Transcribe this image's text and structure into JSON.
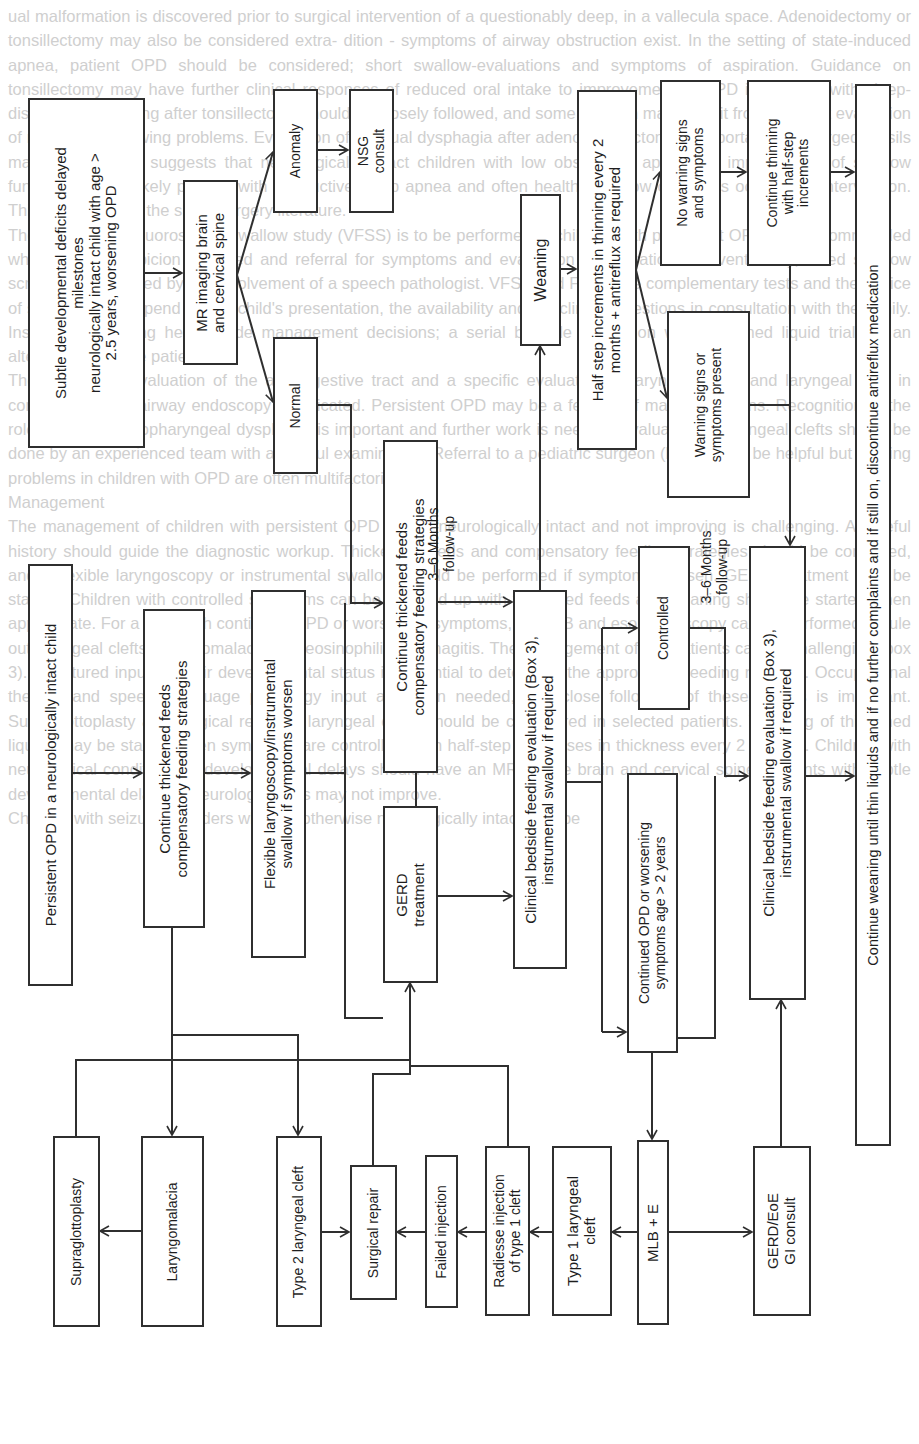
{
  "background_text": {
    "paragraphs": [
      "ual malformation is discovered prior to surgical intervention of a questionably deep, in a vallecula space. Adenoidectomy or tonsillectomy may also be considered extra- dition - symptoms of airway obstruction exist. In the setting of state-induced apnea, patient OPD should be considered; short swallow-evaluations and symptoms of aspiration. Guidance on tonsillectomy may have further clinical responses of reduced oral intake to improvement of OPD in children with sleep-disordered breathing after tonsillectomy should be closely followed, and some children may benefit from a repeat evaluation of reduced swallowing problems. Evaluation of residual dysphagia after adenotonsillectomy is important as enlarged tonsils may contribute to suggests that neurologically intact children with low obstructive apnea, an improvement of swallow function is more likely present with obstructive sleep apnea and often healthy swallow outcomes occur after intervention. This is also true of the sleep surgery literature.",
      "The use of video fluoroscopic swallow study (VFSS) is to be performed in children with persistent OPD. It is recommended when clinical suspicion is raised and referral for symptoms and evaluation of aspiration. Conventionally, failed swallow screening is followed by the involvement of a speech pathologist. VFSS and FEES are complementary tests and the choice of study should depend on the child's presentation, the availability and the clinical questions in consultation with the family. Instrumental testing helps guide management decisions; a serial bedside evaluation with thickened liquid trials is an alternative in some patients.",
      "The concurrent evaluation of the aerodigestive tract and a specific evaluation of laryngomalacia and laryngeal cleft in combination with airway endoscopy is indicated. Persistent OPD may be a feature of many conditions. Recognition of the role of reflux in oropharyngeal dysphagia is important and further work is needed. Evaluation of laryngeal clefts should be done by an experienced team with a careful examination. Referral to a pediatric surgeon (box 3) may be helpful but feeding problems in children with OPD are often multifactorial.",
      "Management",
      "The management of children with persistent OPD that is neurologically intact and not improving is challenging. A careful history should guide the diagnostic workup. Thickened feeds and compensatory feeding strategies should be continued, and a flexible laryngoscopy or instrumental swallow should be performed if symptoms worsen. GERD treatment may be started. Children with controlled symptoms can be followed up with thickened feeds and weaning should be started when appropriate. For a child with continued OPD or worsening symptoms, an MLB and esophagoscopy can be performed to rule out laryngeal clefts, laryngomalacia and eosinophilic esophagitis. The management of OP patients can be challenging (box 3). Structured input on their developmental status is essential to determine the appropriate feeding regimen. Occupational therapy and speech language pathology input are often needed, and close follow-up of these infants is important. Supraglottoplasty and surgical repair of laryngeal clefts should be considered in selected patients. Weaning of thickened liquids may be started when symptoms are controlled, with half-step decreases in thickness every 2 months. Children with neurological conditions or developmental delays should have an MRI of the brain and cervical spine. Patients with subtle developmental delays or neurologic signs may not improve.",
      "Children with seizure disorders who are otherwise neurologically intact may be"
    ]
  },
  "flowchart": {
    "boxes": {
      "subtle_deficits": "Subtle developmental  deficits delayed\nmilestones\nneurologically intact child with age >\n2.5 years, worsening OPD",
      "mr_imaging": "MR imaging brain\nand cervical spine",
      "anomaly": "Anomaly",
      "nsg_consult": "NSG\nconsult",
      "normal": "Normal",
      "persistent_opd": "Persistent OPD in a neurologically  intact child",
      "continue_thickened_1": "Continue thickened  feeds\ncompensatory feeding  strategies",
      "flexible_laryngoscopy": "Flexible  laryngoscopy/instrumental\nswallow  if symptoms  worsen",
      "continue_thickened_2": "Continue thickened  feeds\ncompensatory feeding  strategies",
      "gerd_treatment": "GERD\ntreatment",
      "clinical_bedside_1": "Clinical bedside feeding evaluation (Box 3),\ninstrumental swallow if required",
      "weaning": "Weaning",
      "half_step": "Half step increments in thinning  every 2\nmonths + antireflux as required",
      "no_warning": "No warning signs\nand symptoms",
      "warning_present": "Warning signs or\nsymptoms present",
      "continue_thinning": "Continue thinning\nwith half-step\nincrements",
      "controlled": "Controlled",
      "continued_opd": "Continued OPD or worsening\nsymptoms  age > 2 years",
      "clinical_bedside_2": "Clinical bedside feeding evaluation (Box 3),\ninstrumental swallow if required",
      "continue_weaning": "Continue weaning until thin liquids  and if no further complaints and if still on, discontinue antireflux medication",
      "supraglottoplasty": "Supraglottoplasty",
      "laryngomalacia": "Laryngomalacia",
      "type2_cleft": "Type 2 laryngeal cleft",
      "surgical_repair": "Surgical repair",
      "failed_injection": "Failed injection",
      "radiesse_injection": "Radiesse injection\nof type 1 cleft",
      "type1_cleft": "Type 1 laryngeal\ncleft",
      "mlb_e": "MLB + E",
      "gerd_eoe": "GERD/EoE\nGI consult"
    },
    "labels": {
      "followup_1": "3–6 Months\nfollow-up",
      "followup_2": "3–6 Months\nfollow-up"
    },
    "colors": {
      "line": "#2f2f2f",
      "text": "#1e1e1e",
      "background_text": "#cfcfcf"
    }
  }
}
